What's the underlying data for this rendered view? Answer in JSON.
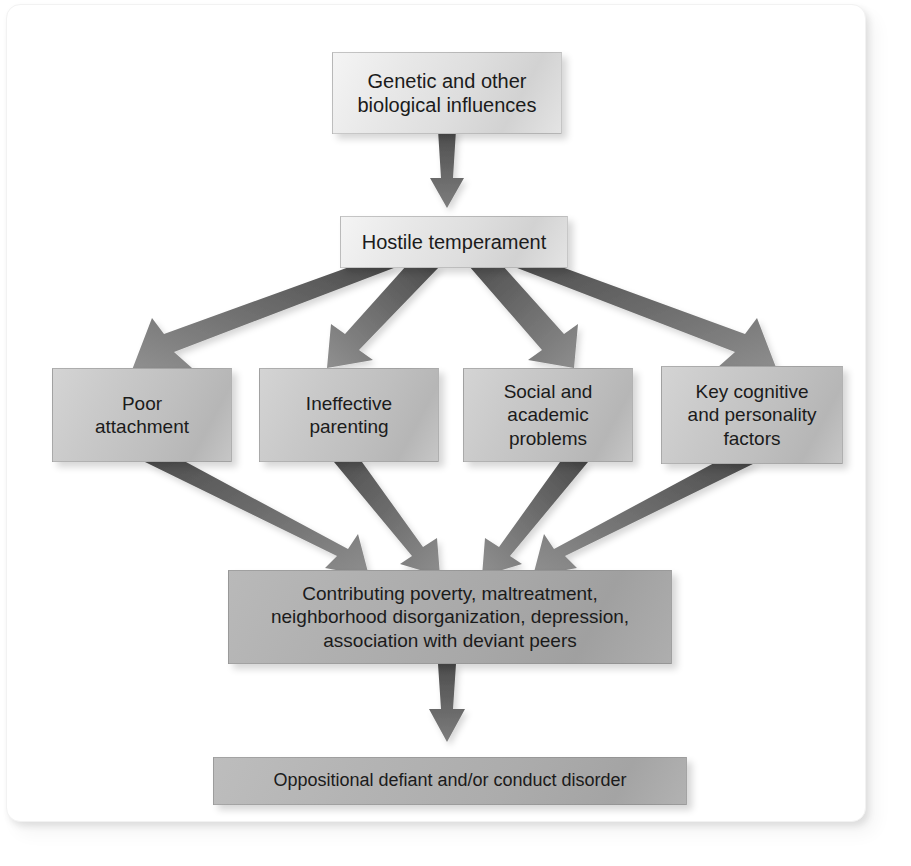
{
  "figure": {
    "type": "flowchart",
    "background_color": "#ffffff",
    "arrow_color": "#6e6e6e"
  },
  "nodes": {
    "genetic": {
      "label": "Genetic and other\nbiological influences",
      "shade": "light",
      "level": 1
    },
    "temperament": {
      "label": "Hostile temperament",
      "shade": "light",
      "level": 2
    },
    "attachment": {
      "label": "Poor\nattachment",
      "shade": "mid",
      "level": 3
    },
    "parenting": {
      "label": "Ineffective\nparenting",
      "shade": "mid",
      "level": 3
    },
    "academic": {
      "label": "Social and\nacademic\nproblems",
      "shade": "mid",
      "level": 3
    },
    "cognitive": {
      "label": "Key cognitive\nand personality\nfactors",
      "shade": "mid",
      "level": 3
    },
    "contributing": {
      "label": "Contributing poverty, maltreatment,\nneighborhood disorganization, depression,\nassociation with deviant peers",
      "shade": "dark",
      "level": 4
    },
    "outcome": {
      "label": "Oppositional defiant and/or conduct disorder",
      "shade": "darker",
      "level": 5
    }
  },
  "edges": [
    {
      "from": "genetic",
      "to": "temperament",
      "style": "straight-down"
    },
    {
      "from": "temperament",
      "to": "attachment",
      "style": "fan-out"
    },
    {
      "from": "temperament",
      "to": "parenting",
      "style": "fan-out"
    },
    {
      "from": "temperament",
      "to": "academic",
      "style": "fan-out"
    },
    {
      "from": "temperament",
      "to": "cognitive",
      "style": "fan-out"
    },
    {
      "from": "attachment",
      "to": "contributing",
      "style": "converge"
    },
    {
      "from": "parenting",
      "to": "contributing",
      "style": "converge"
    },
    {
      "from": "academic",
      "to": "contributing",
      "style": "converge"
    },
    {
      "from": "cognitive",
      "to": "contributing",
      "style": "converge"
    },
    {
      "from": "contributing",
      "to": "outcome",
      "style": "straight-down"
    }
  ]
}
